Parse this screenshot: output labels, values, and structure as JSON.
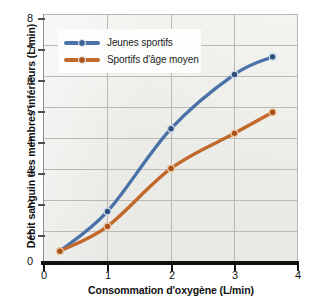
{
  "chart_data": {
    "type": "line",
    "title": "",
    "xlabel": "Consommation d'oxygène (L/min)",
    "ylabel": "Débit sanguin des membres inférieurs (L/min)",
    "xlim": [
      0,
      4
    ],
    "ylim": [
      0,
      8
    ],
    "xticks": [
      "0",
      "1",
      "2",
      "3",
      "4"
    ],
    "xtick_values": [
      0,
      1,
      2,
      3,
      4
    ],
    "yticks": [
      "0",
      "1",
      "2",
      "3",
      "4",
      "5",
      "6",
      "7",
      "8"
    ],
    "ytick_values": [
      0,
      1,
      2,
      3,
      4,
      5,
      6,
      7,
      8
    ],
    "grid": "both",
    "legend_position": "top-left-inside",
    "series": [
      {
        "name": "Jeunes sportifs",
        "color": "#4a72a8",
        "marker": "circle",
        "x": [
          0.25,
          1.0,
          2.0,
          3.0,
          3.6
        ],
        "values": [
          0.35,
          1.63,
          4.3,
          6.05,
          6.62
        ]
      },
      {
        "name": "Sportifs d'âge moyen",
        "color": "#c1682a",
        "marker": "circle",
        "x": [
          0.25,
          1.0,
          2.0,
          3.0,
          3.6
        ],
        "values": [
          0.35,
          1.15,
          3.02,
          4.15,
          4.83
        ]
      }
    ]
  },
  "legend": {
    "entries": [
      {
        "label": "Jeunes sportifs",
        "color": "#4a72a8"
      },
      {
        "label": "Sportifs d'âge moyen",
        "color": "#c1682a"
      }
    ]
  },
  "colors": {
    "young_athletes": "#4a72a8",
    "middle_aged_athletes": "#c1682a",
    "plot_background": "#e9e9e7",
    "gridlines": "#b8b8b4",
    "axis": "#111111"
  }
}
